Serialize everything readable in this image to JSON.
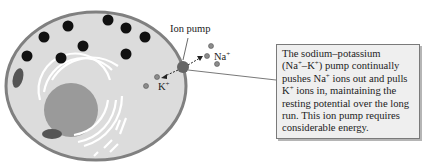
{
  "diagram": {
    "labels": {
      "ion_pump": "Ion pump",
      "na": "Na",
      "na_charge": "+",
      "k": "K",
      "k_charge": "+"
    },
    "callout": {
      "line1": "The sodium–potassium",
      "line2_pre": "(Na",
      "line2_sup1": "+",
      "line2_mid": "–K",
      "line2_sup2": "+",
      "line2_post": ") pump continually",
      "line3_pre": "pushes Na",
      "line3_sup": "+",
      "line3_post": " ions out and pulls",
      "line4_pre": "K",
      "line4_sup": "+",
      "line4_post": " ions in, maintaining the",
      "line5": "resting potential over the long",
      "line6": "run. This ion pump requires",
      "line7": "considerable energy."
    },
    "colors": {
      "cytoplasm": "#dcdcdc",
      "membrane": "#808080",
      "nucleus": "#9a9a9a",
      "vesicle": "#111111",
      "ion": "#8c8c8c",
      "callout_bg": "#efefef"
    }
  }
}
